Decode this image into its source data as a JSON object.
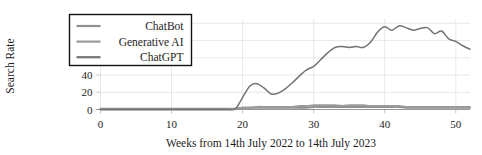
{
  "chart_data": {
    "type": "line",
    "title": "",
    "xlabel": "Weeks from 14th July 2022 to 14th July 2023",
    "ylabel": "Search Rate",
    "xlim": [
      0,
      52
    ],
    "ylim": [
      0,
      105
    ],
    "xticks": [
      0,
      10,
      20,
      30,
      40,
      50
    ],
    "yticks": [
      0,
      20,
      40,
      60,
      80,
      100
    ],
    "xtick_labels": [
      "0",
      "10",
      "20",
      "30",
      "40",
      "50"
    ],
    "ytick_labels": [
      "0",
      "20",
      "40",
      "60",
      "80",
      "100"
    ],
    "grid": true,
    "legend_position": "upper-left",
    "x": [
      0,
      1,
      2,
      3,
      4,
      5,
      6,
      7,
      8,
      9,
      10,
      11,
      12,
      13,
      14,
      15,
      16,
      17,
      18,
      19,
      20,
      21,
      22,
      23,
      24,
      25,
      26,
      27,
      28,
      29,
      30,
      31,
      32,
      33,
      34,
      35,
      36,
      37,
      38,
      39,
      40,
      41,
      42,
      43,
      44,
      45,
      46,
      47,
      48,
      49,
      50,
      51,
      52
    ],
    "series": [
      {
        "name": "ChatBot",
        "color": "#8f8f8f",
        "values": [
          1,
          1,
          1,
          1,
          1,
          1,
          1,
          1,
          1,
          1,
          1,
          1,
          1,
          1,
          1,
          1,
          1,
          1,
          1,
          1,
          2,
          2,
          2,
          2,
          2,
          2,
          2,
          2,
          2,
          2,
          3,
          3,
          3,
          3,
          3,
          3,
          3,
          3,
          3,
          3,
          3,
          3,
          3,
          2,
          2,
          2,
          2,
          2,
          2,
          2,
          2,
          2,
          2
        ]
      },
      {
        "name": "Generative AI",
        "color": "#9a9a9a",
        "values": [
          0,
          0,
          0,
          0,
          0,
          0,
          0,
          0,
          0,
          0,
          0,
          0,
          0,
          0,
          0,
          0,
          0,
          0,
          0,
          1,
          2,
          2,
          3,
          3,
          3,
          3,
          3,
          3,
          4,
          4,
          5,
          5,
          5,
          5,
          4,
          5,
          5,
          5,
          4,
          4,
          4,
          4,
          4,
          3,
          3,
          3,
          3,
          3,
          3,
          3,
          3,
          3,
          3
        ]
      },
      {
        "name": "ChatGPT",
        "color": "#737373",
        "values": [
          0,
          0,
          0,
          0,
          0,
          0,
          0,
          0,
          0,
          0,
          0,
          0,
          0,
          0,
          0,
          0,
          0,
          0,
          0,
          1,
          14,
          27,
          30,
          25,
          18,
          19,
          24,
          31,
          39,
          46,
          50,
          58,
          66,
          72,
          73,
          72,
          73,
          72,
          78,
          90,
          96,
          92,
          97,
          95,
          92,
          94,
          95,
          88,
          91,
          82,
          79,
          74,
          70
        ]
      }
    ]
  },
  "legend": {
    "entries": [
      {
        "label": "ChatBot"
      },
      {
        "label": "Generative AI"
      },
      {
        "label": "ChatGPT"
      }
    ]
  }
}
